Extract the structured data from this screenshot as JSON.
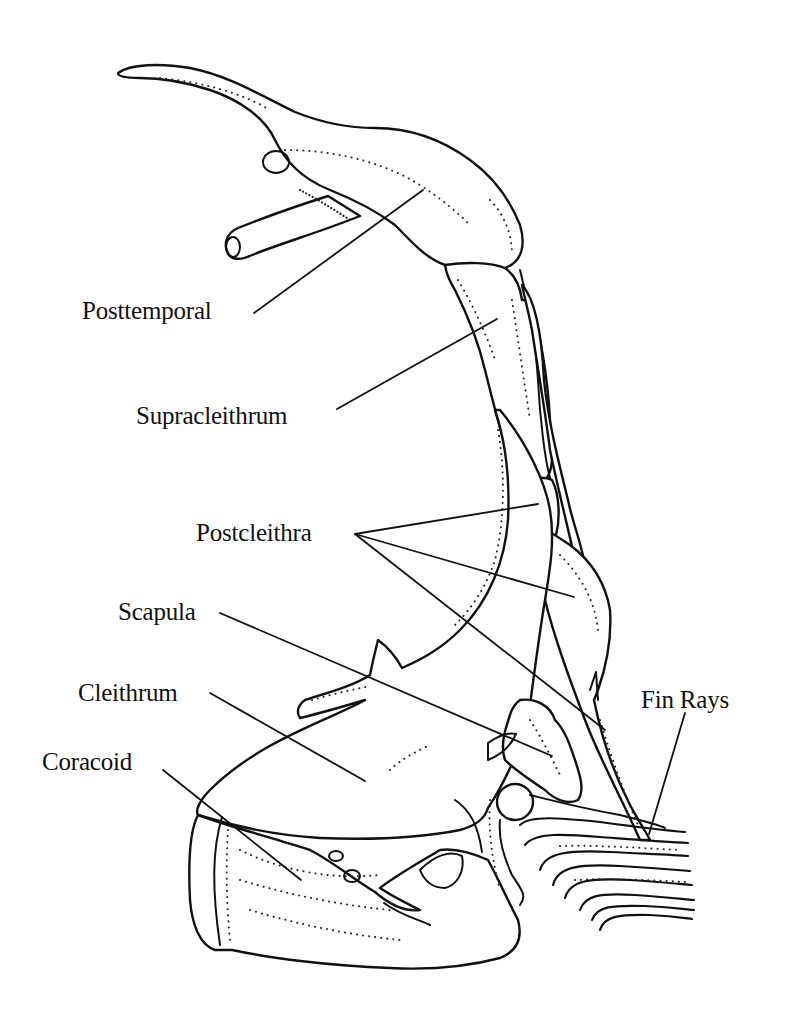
{
  "figure": {
    "background_color": "#ffffff",
    "ink_color": "#111111",
    "labels": [
      {
        "id": "posttemporal",
        "text": "Posttemporal",
        "x": 82,
        "y": 278
      },
      {
        "id": "supracleithrum",
        "text": "Supracleithrum",
        "x": 136,
        "y": 403
      },
      {
        "id": "postcleithra",
        "text": "Postcleithra",
        "x": 196,
        "y": 520
      },
      {
        "id": "scapula",
        "text": "Scapula",
        "x": 118,
        "y": 599
      },
      {
        "id": "cleithrum",
        "text": "Cleithrum",
        "x": 78,
        "y": 680
      },
      {
        "id": "coracoid",
        "text": "Coracoid",
        "x": 42,
        "y": 749
      },
      {
        "id": "fin-rays",
        "text": "Fin Rays",
        "x": 641,
        "y": 687
      }
    ]
  }
}
